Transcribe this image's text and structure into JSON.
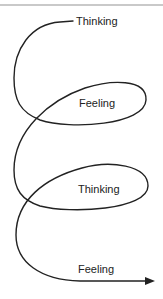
{
  "diagram": {
    "type": "spiral-flow",
    "labels": [
      {
        "text": "Thinking",
        "x": 76,
        "y": 15
      },
      {
        "text": "Feeling",
        "x": 79,
        "y": 97
      },
      {
        "text": "Thinking",
        "x": 78,
        "y": 183
      },
      {
        "text": "Feeling",
        "x": 78,
        "y": 263
      }
    ],
    "line_color": "#222222",
    "rule_color": "#c9c9c9",
    "arrow": "arrow-right"
  }
}
